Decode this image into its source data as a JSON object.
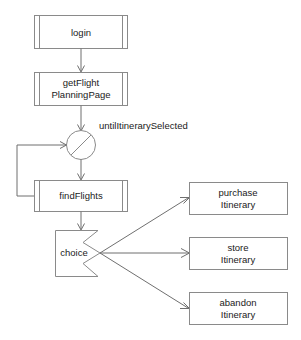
{
  "diagram": {
    "type": "uml-activity-diagram",
    "background_color": "#ffffff",
    "line_color": "#8a8a8a",
    "text_color": "#1a1a1a",
    "nodes": [
      {
        "id": "login",
        "shape": "activity-box",
        "label": "login"
      },
      {
        "id": "getFlightPlanningPage",
        "shape": "activity-box",
        "label_line1": "getFlight",
        "label_line2": "PlanningPage"
      },
      {
        "id": "loop",
        "shape": "circle-with-diagonal",
        "label": ""
      },
      {
        "id": "findFlights",
        "shape": "activity-box",
        "label": "findFlights"
      },
      {
        "id": "choice",
        "shape": "choice-zigzag",
        "label": "choice"
      },
      {
        "id": "purchaseItinerary",
        "shape": "plain-box",
        "label_line1": "purchase",
        "label_line2": "Itinerary"
      },
      {
        "id": "storeItinerary",
        "shape": "plain-box",
        "label_line1": "store",
        "label_line2": "Itinerary"
      },
      {
        "id": "abandonItinerary",
        "shape": "plain-box",
        "label_line1": "abandon",
        "label_line2": "Itinerary"
      }
    ],
    "edges": [
      {
        "from": "login",
        "to": "getFlightPlanningPage",
        "label": ""
      },
      {
        "from": "getFlightPlanningPage",
        "to": "loop",
        "label": "untilItinerarySelected"
      },
      {
        "from": "loop",
        "to": "findFlights",
        "label": ""
      },
      {
        "from": "findFlights",
        "to": "loop",
        "label": ""
      },
      {
        "from": "findFlights",
        "to": "choice",
        "label": ""
      },
      {
        "from": "choice",
        "to": "purchaseItinerary",
        "label": ""
      },
      {
        "from": "choice",
        "to": "storeItinerary",
        "label": ""
      },
      {
        "from": "choice",
        "to": "abandonItinerary",
        "label": ""
      }
    ],
    "labels": {
      "login": "login",
      "getflight_line1": "getFlight",
      "getflight_line2": "PlanningPage",
      "loop_guard": "untilItinerarySelected",
      "findflights": "findFlights",
      "choice": "choice",
      "purchase_line1": "purchase",
      "purchase_line2": "Itinerary",
      "store_line1": "store",
      "store_line2": "Itinerary",
      "abandon_line1": "abandon",
      "abandon_line2": "Itinerary"
    }
  }
}
